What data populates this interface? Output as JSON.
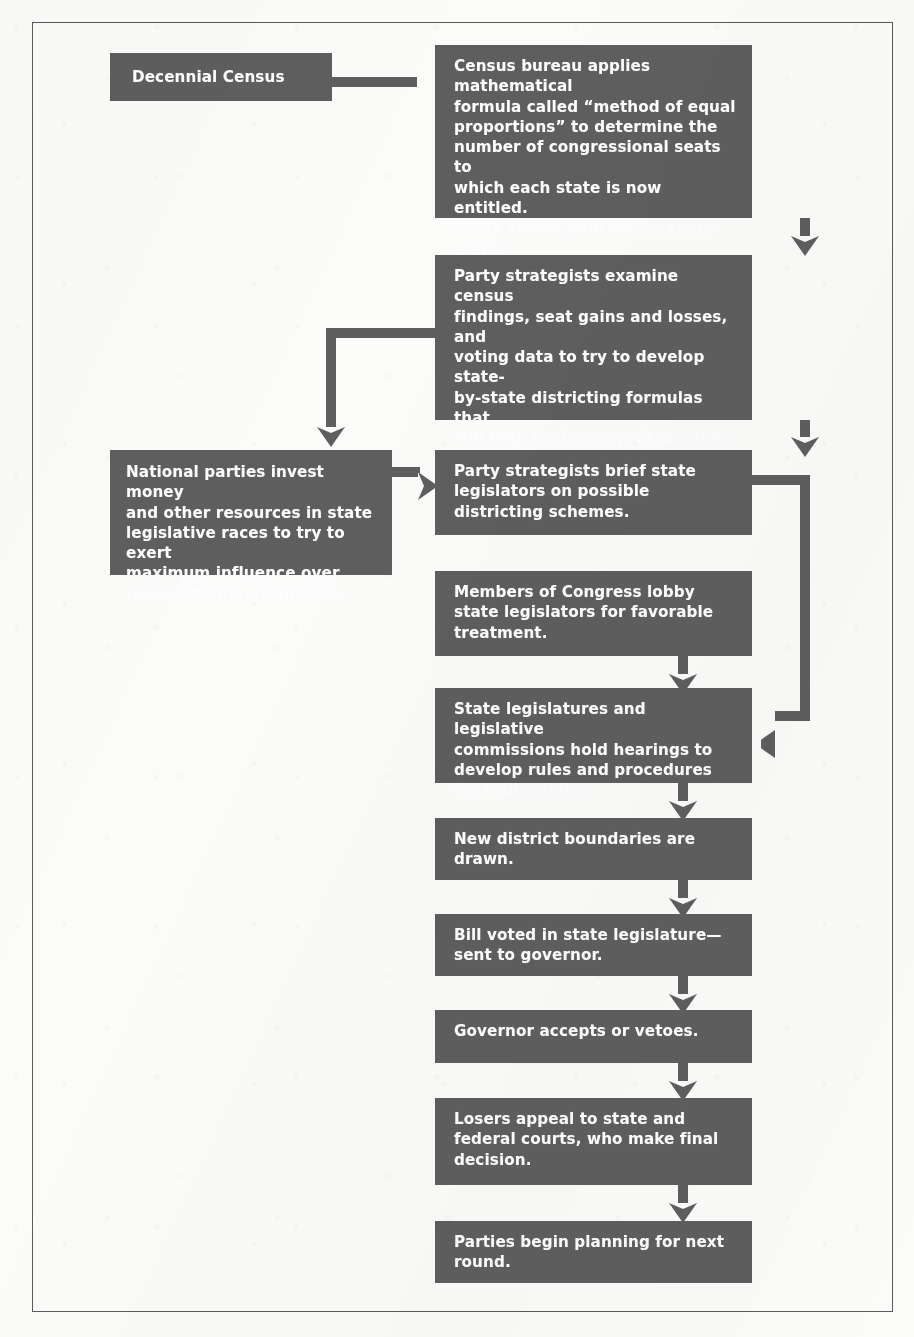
{
  "diagram": {
    "type": "flowchart",
    "orientation": "top-to-bottom",
    "box_fill_color": "#5e5e5e",
    "box_text_color": "#ffffff",
    "connector_color": "#5e5e5e",
    "page_background": "#fbfbfa",
    "frame_border_color": "#5b5b5b",
    "nodes": [
      {
        "id": "decennial-census",
        "text": "Decennial Census"
      },
      {
        "id": "census-bureau-formula",
        "text": "Census bureau applies mathematical\nformula called “method of equal\nproportions” to determine the\nnumber of congressional seats to\nwhich each state is now entitled.\nSome states gain seats; some states\nlose seats; others remain unchanged."
      },
      {
        "id": "party-strategists-examine",
        "text": "Party strategists examine census\nfindings, seat gains and losses, and\nvoting data to try to develop state-\nby-state districting formulas that\nwill help their party. Strategists\nalso examine election laws and\nrecent court decisions."
      },
      {
        "id": "national-parties-invest",
        "text": "National parties invest money\nand other resources in state\nlegislative races to try to exert\nmaximum influence over\nreapportionment process."
      },
      {
        "id": "party-strategists-brief",
        "text": "Party strategists brief state\nlegislators on possible\ndistricting schemes."
      },
      {
        "id": "members-of-congress-lobby",
        "text": "Members of Congress lobby\nstate legislators for favorable\ntreatment."
      },
      {
        "id": "state-legislatures-hearings",
        "text": "State legislatures and legislative\ncommissions hold hearings to\ndevelop rules and procedures\nfor redistricting."
      },
      {
        "id": "new-district-boundaries",
        "text": "New district boundaries are\ndrawn."
      },
      {
        "id": "bill-voted",
        "text": "Bill voted in state legislature—\nsent to governor."
      },
      {
        "id": "governor-accepts-vetoes",
        "text": "Governor accepts or vetoes."
      },
      {
        "id": "losers-appeal",
        "text": "Losers appeal to state and\nfederal courts, who make final\ndecision."
      },
      {
        "id": "parties-begin-planning",
        "text": "Parties begin planning for next\nround."
      }
    ],
    "edges": [
      {
        "from": "decennial-census",
        "to": "census-bureau-formula",
        "direction": "right"
      },
      {
        "from": "census-bureau-formula",
        "to": "party-strategists-examine",
        "direction": "down"
      },
      {
        "from": "party-strategists-examine",
        "to": "national-parties-invest",
        "direction": "left-then-down"
      },
      {
        "from": "party-strategists-examine",
        "to": "party-strategists-brief",
        "direction": "down"
      },
      {
        "from": "national-parties-invest",
        "to": "party-strategists-brief",
        "direction": "right"
      },
      {
        "from": "party-strategists-brief",
        "to": "state-legislatures-hearings",
        "direction": "right-then-down-then-left"
      },
      {
        "from": "members-of-congress-lobby",
        "to": "state-legislatures-hearings",
        "direction": "down"
      },
      {
        "from": "state-legislatures-hearings",
        "to": "new-district-boundaries",
        "direction": "down"
      },
      {
        "from": "new-district-boundaries",
        "to": "bill-voted",
        "direction": "down"
      },
      {
        "from": "bill-voted",
        "to": "governor-accepts-vetoes",
        "direction": "down"
      },
      {
        "from": "governor-accepts-vetoes",
        "to": "losers-appeal",
        "direction": "down"
      },
      {
        "from": "losers-appeal",
        "to": "parties-begin-planning",
        "direction": "down"
      }
    ]
  }
}
